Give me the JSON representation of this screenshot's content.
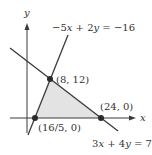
{
  "diagram": {
    "axes": {
      "x_label": "x",
      "y_label": "y"
    },
    "lines": [
      {
        "equation": "−5x + 2y = −16",
        "prefix": "−5",
        "var1": "x",
        "mid": " + 2",
        "var2": "y",
        "suffix": " = −16"
      },
      {
        "equation": "3x + 4y = 72",
        "prefix": "3",
        "var1": "x",
        "mid": " + 4",
        "var2": "y",
        "suffix": " = 72"
      }
    ],
    "points": [
      {
        "label": "(8, 12)"
      },
      {
        "label": "(16/5, 0)"
      },
      {
        "label": "(24, 0)"
      }
    ],
    "colors": {
      "line": "#3a3a3a",
      "region_fill": "#e3e3e3",
      "point": "#2a2a2a"
    }
  }
}
